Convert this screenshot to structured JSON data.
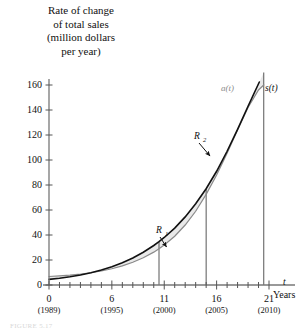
{
  "figure": {
    "y_axis_caption_lines": [
      "Rate of change",
      "of total sales",
      "(million dollars",
      "per year)"
    ],
    "x_axis_label_symbol": "t",
    "x_axis_label_text": "Years",
    "caption": "FIGURE 5.17"
  },
  "chart_data": {
    "type": "line",
    "title": "",
    "xlabel": "Years",
    "ylabel": "Rate of change of total sales (million dollars per year)",
    "xlim": [
      0,
      21
    ],
    "ylim": [
      0,
      160
    ],
    "grid": false,
    "legend": "inline-curve-labels",
    "x_ticks": [
      0,
      6,
      11,
      16,
      21
    ],
    "x_tick_sublabels": [
      "(1989)",
      "(1995)",
      "(2000)",
      "(2005)",
      "(2010)"
    ],
    "x_minor_tick_step": 1,
    "y_ticks": [
      0,
      20,
      40,
      60,
      80,
      100,
      120,
      140,
      160
    ],
    "series": [
      {
        "name": "s(t)",
        "label": "s(t)",
        "color": "#111111",
        "x": [
          0,
          1,
          2,
          3,
          4,
          5,
          6,
          7,
          8,
          9,
          10,
          10.5,
          11,
          12,
          13,
          14,
          15,
          16,
          17,
          18,
          19,
          20,
          20.5,
          21
        ],
        "values": [
          4.5,
          5.4,
          6.6,
          8.0,
          9.8,
          12.0,
          14.6,
          17.8,
          21.6,
          26.2,
          31.6,
          34.7,
          38.0,
          45.5,
          54.5,
          65.0,
          77.0,
          91.0,
          107.0,
          124.5,
          143.0,
          161.0,
          170.0,
          178.0
        ]
      },
      {
        "name": "a(t)",
        "label": "a(t)",
        "color": "#8a8a8a",
        "x": [
          0,
          1,
          2,
          3,
          4,
          5,
          6,
          7,
          8,
          9,
          10,
          10.5,
          11,
          12,
          13,
          14,
          15,
          16,
          17,
          18,
          19,
          20,
          20.5
        ],
        "values": [
          6.8,
          7.3,
          7.9,
          8.7,
          9.8,
          11.2,
          13.0,
          15.3,
          18.2,
          21.8,
          26.3,
          29.0,
          32.0,
          39.0,
          48.0,
          59.0,
          72.5,
          88.0,
          105.5,
          124.0,
          142.0,
          156.0,
          160.0
        ]
      }
    ],
    "shaded_regions": [
      {
        "name": "R_1",
        "label": "R",
        "subscript": "1",
        "x_range": [
          0,
          15
        ],
        "description": "region between s(t) above and a(t) below, from t=0 to crossing at t=15",
        "fill": "#e9e9e9"
      },
      {
        "name": "R_2",
        "label": "R",
        "subscript": "2",
        "x_range": [
          15,
          20.5
        ],
        "description": "region between a(t) above and s(t) below, from crossing at t=15 to t=20.5",
        "fill": "#e9e9e9"
      }
    ],
    "vertical_lines": [
      10.5,
      15,
      20.5
    ],
    "curve_crossings": [
      {
        "x": 15,
        "y": 43
      }
    ]
  }
}
